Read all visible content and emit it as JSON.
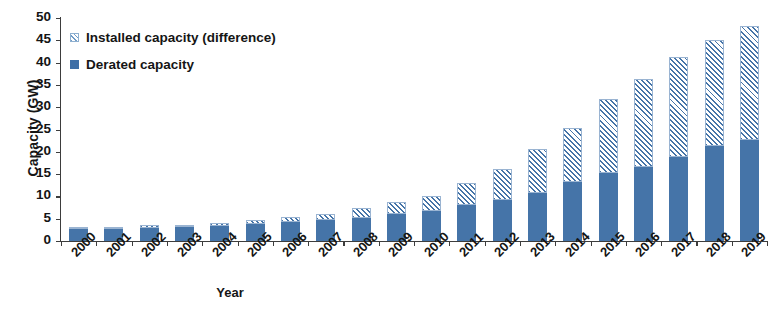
{
  "chart_data": {
    "type": "bar",
    "stacked": true,
    "title": "",
    "xlabel": "Year",
    "ylabel": "Capacity (GW)",
    "ylim": [
      0,
      50
    ],
    "ytick_step": 5,
    "yticks": [
      0,
      5,
      10,
      15,
      20,
      25,
      30,
      35,
      40,
      45,
      50
    ],
    "grid": false,
    "legend_position": "top-left",
    "categories": [
      "2000",
      "2001",
      "2002",
      "2003",
      "2004",
      "2005",
      "2006",
      "2007",
      "2008",
      "2009",
      "2010",
      "2011",
      "2012",
      "2013",
      "2014",
      "2015",
      "2016",
      "2017",
      "2018",
      "2019"
    ],
    "series": [
      {
        "name": "Derated capacity",
        "color": "#4574a8",
        "fill": "solid",
        "values": [
          2.6,
          2.8,
          3.0,
          3.1,
          3.4,
          3.8,
          4.2,
          4.6,
          5.2,
          6.0,
          6.8,
          8.0,
          9.3,
          10.8,
          13.3,
          15.2,
          16.6,
          18.8,
          21.2,
          22.7
        ]
      },
      {
        "name": "Installed capacity (difference)",
        "color": "#6f9bc7",
        "fill": "hatched",
        "values": [
          0.4,
          0.4,
          0.5,
          0.6,
          0.7,
          0.9,
          1.2,
          1.5,
          2.2,
          2.7,
          3.4,
          4.9,
          6.8,
          9.9,
          12.0,
          16.6,
          19.7,
          22.5,
          23.9,
          25.4
        ]
      }
    ],
    "totals_installed": [
      3.0,
      3.2,
      3.5,
      3.7,
      4.1,
      4.7,
      5.4,
      6.1,
      7.4,
      8.7,
      10.2,
      12.9,
      16.1,
      20.7,
      25.3,
      31.8,
      36.3,
      41.3,
      45.1,
      48.1
    ]
  },
  "legend": {
    "items": [
      {
        "label": "Installed capacity (difference)",
        "style": "hatched"
      },
      {
        "label": "Derated capacity",
        "style": "solid"
      }
    ]
  },
  "axes": {
    "y_title": "Capacity (GW)",
    "x_title": "Year"
  },
  "colors": {
    "series_solid": "#4574a8",
    "series_hatch": "#6f9bc7",
    "axis": "#3d3d3d",
    "text": "#141414",
    "background": "#ffffff"
  }
}
